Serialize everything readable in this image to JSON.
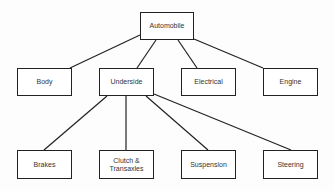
{
  "diagram": {
    "type": "tree",
    "root": {
      "id": "automobile",
      "label": "Automobile",
      "box": [
        140,
        12,
        54,
        28
      ]
    },
    "level1": [
      {
        "id": "body",
        "label": "Body",
        "box": [
          17,
          68,
          55,
          28
        ]
      },
      {
        "id": "underside",
        "label": "Underside",
        "box": [
          99,
          68,
          55,
          28
        ]
      },
      {
        "id": "electrical",
        "label": "Electrical",
        "box": [
          181,
          68,
          55,
          28
        ]
      },
      {
        "id": "engine",
        "label": "Engine",
        "box": [
          263,
          68,
          55,
          28
        ]
      }
    ],
    "level2": [
      {
        "id": "brakes",
        "label": "Brakes",
        "box": [
          17,
          150,
          55,
          29
        ]
      },
      {
        "id": "clutch",
        "label": "Clutch & Transaxles",
        "box": [
          99,
          150,
          55,
          29
        ]
      },
      {
        "id": "suspension",
        "label": "Suspension",
        "box": [
          181,
          150,
          55,
          29
        ]
      },
      {
        "id": "steering",
        "label": "Steering",
        "box": [
          263,
          150,
          55,
          29
        ]
      }
    ],
    "edges": [
      {
        "from": "automobile",
        "to": "body",
        "line": [
          140,
          35,
          70,
          68
        ]
      },
      {
        "from": "automobile",
        "to": "underside",
        "line": [
          156,
          40,
          137,
          68
        ]
      },
      {
        "from": "automobile",
        "to": "electrical",
        "line": [
          178,
          40,
          197,
          68
        ]
      },
      {
        "from": "automobile",
        "to": "engine",
        "line": [
          194,
          39,
          263,
          68
        ]
      },
      {
        "from": "underside",
        "to": "brakes",
        "line": [
          107,
          96,
          44,
          150
        ]
      },
      {
        "from": "underside",
        "to": "clutch",
        "line": [
          126,
          96,
          126,
          150
        ]
      },
      {
        "from": "underside",
        "to": "suspension",
        "line": [
          146,
          96,
          208,
          150
        ]
      },
      {
        "from": "underside",
        "to": "steering",
        "line": [
          154,
          94,
          291,
          150
        ]
      }
    ],
    "colors": {
      "line": "#222222",
      "text": "#333333",
      "background": "#ffffff"
    }
  }
}
